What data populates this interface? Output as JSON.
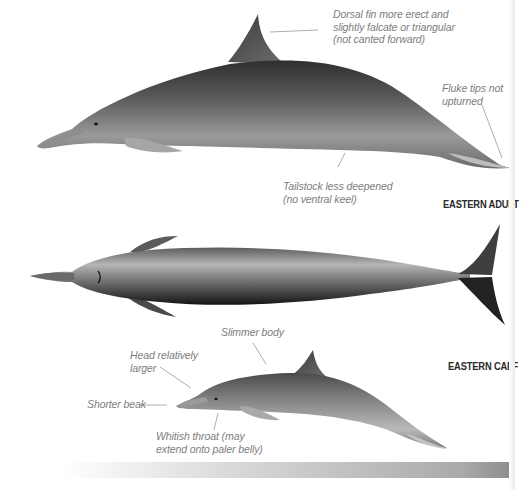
{
  "figure": {
    "colors": {
      "background": "#ffffff",
      "annotation_text": "#7d7d7d",
      "label_text": "#2a2a2a",
      "body_dark": "#3a3a3a",
      "body_mid": "#8c8c8c",
      "body_light": "#c9c9c9"
    }
  },
  "annotations": {
    "dorsal_fin": [
      "Dorsal fin more erect and",
      "slightly falcate or triangular",
      "(not canted forward)"
    ],
    "fluke_tips": [
      "Fluke tips not",
      "upturned"
    ],
    "tailstock": [
      "Tailstock less deepened",
      "(no ventral keel)"
    ],
    "slimmer_body": [
      "Slimmer body"
    ],
    "head_larger": [
      "Head relatively",
      "larger"
    ],
    "shorter_beak": [
      "Shorter beak"
    ],
    "whitish_throat": [
      "Whitish throat (may",
      "extend onto paler belly)"
    ]
  },
  "labels": {
    "adult": "EASTERN ADULT",
    "calf": "EASTERN CALF"
  }
}
